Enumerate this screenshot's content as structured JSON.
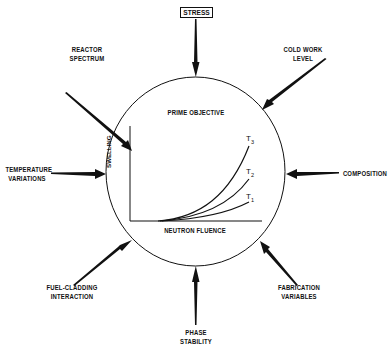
{
  "diagram": {
    "center_title": "PRIME OBJECTIVE",
    "inner_chart": {
      "ylabel": "SWELLING",
      "xlabel": "NEUTRON FLUENCE",
      "curves": [
        {
          "name": "T",
          "subscript": "3"
        },
        {
          "name": "T",
          "subscript": "2"
        },
        {
          "name": "T",
          "subscript": "1"
        }
      ]
    },
    "factors": {
      "top": "STRESS",
      "top_left": [
        "REACTOR",
        "SPECTRUM"
      ],
      "top_right": [
        "COLD WORK",
        "LEVEL"
      ],
      "left": [
        "TEMPERATURE",
        "VARIATIONS"
      ],
      "right": [
        "COMPOSITION"
      ],
      "bottom_left": [
        "FUEL-CLADDING",
        "INTERACTION"
      ],
      "bottom_right": [
        "FABRICATION",
        "VARIABLES"
      ],
      "bottom": [
        "PHASE",
        "STABILITY"
      ]
    },
    "colors": {
      "ink": "#111111",
      "background": "#ffffff"
    }
  }
}
